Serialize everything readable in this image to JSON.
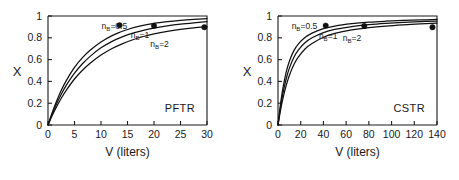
{
  "figure": {
    "background": "#ffffff",
    "line_color": "#111111",
    "marker_color": "#111111"
  },
  "chart_data": [
    {
      "type": "line",
      "panel": "left",
      "title": "",
      "annotation": "PFTR",
      "xlabel": "V (liters)",
      "ylabel": "X",
      "xlim": [
        0,
        30
      ],
      "ylim": [
        0,
        1
      ],
      "xticks": [
        0,
        5,
        10,
        15,
        20,
        25,
        30
      ],
      "xticklabels": [
        "0",
        "5",
        "10",
        "15",
        "20",
        "25",
        "30"
      ],
      "yticks": [
        0,
        0.2,
        0.4,
        0.6,
        0.8,
        1
      ],
      "yticklabels": [
        "0",
        "0.2",
        "0.4",
        "0.6",
        "0.8",
        "1"
      ],
      "grid": false,
      "legend": "inline-curve-labels",
      "series": [
        {
          "name": "n_B=0.5",
          "label": "n",
          "label_sub": "B",
          "label_eq": "=0.5",
          "label_x": 10.1,
          "label_y": 0.885,
          "x": [
            0,
            0.75,
            1.5,
            2.5,
            3.5,
            5,
            6.5,
            8,
            10,
            12,
            13.5,
            15,
            17.5,
            20,
            22.5,
            25,
            27.5,
            30
          ],
          "y": [
            0,
            0.108,
            0.205,
            0.318,
            0.412,
            0.528,
            0.618,
            0.688,
            0.762,
            0.818,
            0.85,
            0.876,
            0.909,
            0.932,
            0.948,
            0.96,
            0.969,
            0.976
          ],
          "marker": {
            "x": 13.5,
            "y": 0.915
          }
        },
        {
          "name": "n_B=1",
          "label": "n",
          "label_sub": "B",
          "label_eq": "=1",
          "label_x": 15.6,
          "label_y": 0.8,
          "x": [
            0,
            0.75,
            1.5,
            2.5,
            3.5,
            5,
            6.5,
            8,
            10,
            12,
            14,
            16,
            18,
            20,
            22.5,
            25,
            27.5,
            30
          ],
          "y": [
            0,
            0.095,
            0.182,
            0.282,
            0.368,
            0.475,
            0.562,
            0.632,
            0.708,
            0.765,
            0.808,
            0.842,
            0.868,
            0.889,
            0.91,
            0.926,
            0.938,
            0.948
          ],
          "marker": {
            "x": 20.0,
            "y": 0.91
          }
        },
        {
          "name": "n_B=2",
          "label": "n",
          "label_sub": "B",
          "label_eq": "=2",
          "label_x": 19.3,
          "label_y": 0.715,
          "x": [
            0,
            0.75,
            1.5,
            2.5,
            3.5,
            5,
            6.5,
            8,
            10,
            12,
            14,
            16,
            18,
            20,
            22.5,
            25,
            27.5,
            30
          ],
          "y": [
            0,
            0.082,
            0.156,
            0.245,
            0.322,
            0.422,
            0.502,
            0.568,
            0.642,
            0.7,
            0.745,
            0.782,
            0.812,
            0.836,
            0.859,
            0.877,
            0.891,
            0.902
          ],
          "marker": {
            "x": 29.5,
            "y": 0.897
          }
        }
      ]
    },
    {
      "type": "line",
      "panel": "right",
      "title": "",
      "annotation": "CSTR",
      "xlabel": "V (liters)",
      "ylabel": "X",
      "xlim": [
        0,
        140
      ],
      "ylim": [
        0,
        1
      ],
      "xticks": [
        0,
        20,
        40,
        60,
        80,
        100,
        120,
        140
      ],
      "xticklabels": [
        "0",
        "20",
        "40",
        "60",
        "80",
        "100",
        "120",
        "140"
      ],
      "yticks": [
        0,
        0.2,
        0.4,
        0.6,
        0.8,
        1
      ],
      "yticklabels": [
        "0",
        "0.2",
        "0.4",
        "0.6",
        "0.8",
        "1"
      ],
      "grid": false,
      "legend": "inline-curve-labels",
      "series": [
        {
          "name": "n_B=0.5",
          "label": "n",
          "label_sub": "B",
          "label_eq": "=0.5",
          "label_x": 12.0,
          "label_y": 0.885,
          "x": [
            0,
            2,
            4,
            7,
            10,
            14,
            18,
            24,
            30,
            40,
            50,
            65,
            80,
            95,
            110,
            125,
            140
          ],
          "y": [
            0,
            0.175,
            0.318,
            0.475,
            0.585,
            0.682,
            0.745,
            0.805,
            0.843,
            0.884,
            0.908,
            0.929,
            0.943,
            0.952,
            0.959,
            0.964,
            0.968
          ],
          "marker": {
            "x": 42.0,
            "y": 0.912
          }
        },
        {
          "name": "n_B=1",
          "label": "n",
          "label_sub": "B",
          "label_eq": "=1",
          "label_x": 36.0,
          "label_y": 0.79,
          "x": [
            0,
            2,
            4,
            7,
            10,
            14,
            18,
            24,
            30,
            40,
            50,
            65,
            80,
            95,
            110,
            125,
            140
          ],
          "y": [
            0,
            0.148,
            0.272,
            0.415,
            0.522,
            0.622,
            0.69,
            0.757,
            0.8,
            0.848,
            0.877,
            0.903,
            0.92,
            0.932,
            0.941,
            0.948,
            0.953
          ],
          "marker": {
            "x": 76.0,
            "y": 0.908
          }
        },
        {
          "name": "n_B=2",
          "label": "n",
          "label_sub": "B",
          "label_eq": "=2",
          "label_x": 57.0,
          "label_y": 0.775,
          "x": [
            0,
            2,
            4,
            7,
            10,
            14,
            18,
            24,
            30,
            40,
            50,
            65,
            80,
            95,
            110,
            125,
            140
          ],
          "y": [
            0,
            0.122,
            0.228,
            0.355,
            0.455,
            0.555,
            0.625,
            0.7,
            0.748,
            0.805,
            0.84,
            0.872,
            0.893,
            0.908,
            0.919,
            0.928,
            0.935
          ],
          "marker": {
            "x": 136.0,
            "y": 0.897
          }
        }
      ]
    }
  ]
}
